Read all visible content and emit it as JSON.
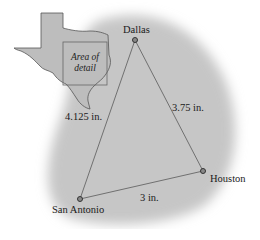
{
  "diagram": {
    "type": "triangle-map",
    "inset": {
      "region": "Texas",
      "label_line1": "Area of",
      "label_line2": "detail"
    },
    "cities": [
      {
        "name": "Dallas",
        "x": 135,
        "y": 40
      },
      {
        "name": "Houston",
        "x": 203,
        "y": 171
      },
      {
        "name": "San Antonio",
        "x": 80,
        "y": 199
      }
    ],
    "distances": [
      {
        "from": "San Antonio",
        "to": "Dallas",
        "label": "4.125 in."
      },
      {
        "from": "Dallas",
        "to": "Houston",
        "label": "3.75 in."
      },
      {
        "from": "San Antonio",
        "to": "Houston",
        "label": "3 in."
      }
    ],
    "colors": {
      "shading": "#c9c9c9",
      "line": "#707070",
      "dot": "#555555"
    }
  }
}
